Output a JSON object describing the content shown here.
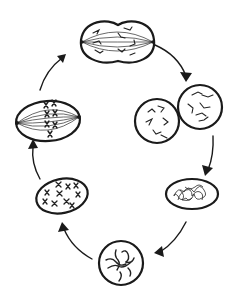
{
  "diagram": {
    "type": "cell-cycle-loop",
    "direction": "clockwise",
    "background": "#ffffff",
    "stroke_color": "#1a1a1a",
    "stages": [
      {
        "id": "telophase-cytokinesis",
        "position": "top",
        "shape": "two-lobed cell with spindle fibers and separating chromosomes"
      },
      {
        "id": "daughter-cells",
        "position": "right-upper",
        "shape": "two round cells with scattered chromosomes"
      },
      {
        "id": "interphase",
        "position": "right-lower",
        "shape": "oval cell with tangled chromatin"
      },
      {
        "id": "prophase",
        "position": "bottom",
        "shape": "round cell with condensing thread-like chromosomes"
      },
      {
        "id": "prometaphase",
        "position": "left-lower",
        "shape": "oval cell with X-shaped chromosomes"
      },
      {
        "id": "metaphase",
        "position": "left-upper",
        "shape": "spindle-shaped cell with chromosomes aligned at center"
      }
    ],
    "arrows": [
      {
        "from": "telophase-cytokinesis",
        "to": "daughter-cells"
      },
      {
        "from": "daughter-cells",
        "to": "interphase"
      },
      {
        "from": "interphase",
        "to": "prophase"
      },
      {
        "from": "prophase",
        "to": "prometaphase"
      },
      {
        "from": "prometaphase",
        "to": "metaphase"
      },
      {
        "from": "metaphase",
        "to": "telophase-cytokinesis"
      }
    ]
  }
}
